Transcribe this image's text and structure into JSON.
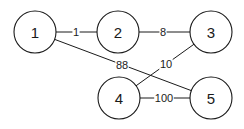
{
  "graph": {
    "nodes": [
      {
        "id": "1",
        "label": "1",
        "x": 35,
        "y": 32,
        "r": 21
      },
      {
        "id": "2",
        "label": "2",
        "x": 118,
        "y": 32,
        "r": 21
      },
      {
        "id": "3",
        "label": "3",
        "x": 211,
        "y": 32,
        "r": 21
      },
      {
        "id": "4",
        "label": "4",
        "x": 119,
        "y": 98,
        "r": 21
      },
      {
        "id": "5",
        "label": "5",
        "x": 211,
        "y": 98,
        "r": 21
      }
    ],
    "edges": [
      {
        "from": "1",
        "to": "2",
        "weight": "1",
        "lx": 76,
        "ly": 32
      },
      {
        "from": "2",
        "to": "3",
        "weight": "8",
        "lx": 163,
        "ly": 32
      },
      {
        "from": "1",
        "to": "5",
        "weight": "88",
        "lx": 122,
        "ly": 65
      },
      {
        "from": "3",
        "to": "4",
        "weight": "10",
        "lx": 166,
        "ly": 64
      },
      {
        "from": "4",
        "to": "5",
        "weight": "100",
        "lx": 164,
        "ly": 98
      }
    ],
    "colors": {
      "stroke": "#1a1a1a",
      "background": "#ffffff"
    }
  }
}
